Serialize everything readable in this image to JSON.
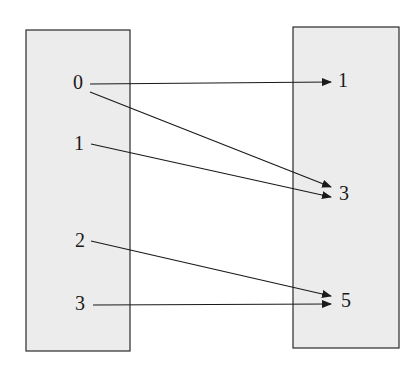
{
  "diagram": {
    "type": "function-mapping",
    "colors": {
      "box_fill": "#ececec",
      "box_stroke": "#2a2a2a",
      "line": "#1a1a1a",
      "text": "#1a1a1a"
    },
    "domain_set": {
      "box": {
        "x": 26,
        "y": 30,
        "w": 104,
        "h": 321
      },
      "elements": [
        {
          "label": "0",
          "x": 78,
          "y": 84
        },
        {
          "label": "1",
          "x": 79,
          "y": 145
        },
        {
          "label": "2",
          "x": 80,
          "y": 242
        },
        {
          "label": "3",
          "x": 80,
          "y": 305
        }
      ]
    },
    "codomain_set": {
      "box": {
        "x": 293,
        "y": 27,
        "w": 106,
        "h": 321
      },
      "elements": [
        {
          "label": "1",
          "x": 343,
          "y": 82
        },
        {
          "label": "3",
          "x": 344,
          "y": 195
        },
        {
          "label": "5",
          "x": 346,
          "y": 302
        }
      ]
    },
    "mappings": [
      {
        "from": "0",
        "to": "1",
        "x1": 90,
        "y1": 84,
        "x2": 331,
        "y2": 82
      },
      {
        "from": "0",
        "to": "3",
        "x1": 90,
        "y1": 92,
        "x2": 331,
        "y2": 187
      },
      {
        "from": "1",
        "to": "3",
        "x1": 91,
        "y1": 144,
        "x2": 331,
        "y2": 197
      },
      {
        "from": "2",
        "to": "5",
        "x1": 91,
        "y1": 241,
        "x2": 331,
        "y2": 296
      },
      {
        "from": "3",
        "to": "5",
        "x1": 93,
        "y1": 305,
        "x2": 331,
        "y2": 304
      }
    ]
  }
}
